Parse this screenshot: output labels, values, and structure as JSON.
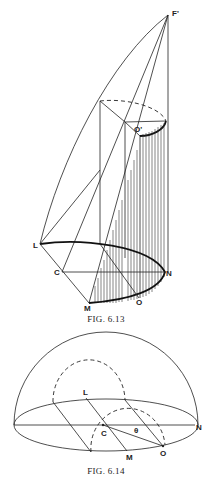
{
  "figures": [
    {
      "id": "fig-6-13",
      "caption": "FIG. 6.13",
      "labels": {
        "apex": "F'",
        "top_center": "O'",
        "L": "L",
        "C": "C",
        "N": "N",
        "M": "M",
        "O": "O"
      }
    },
    {
      "id": "fig-6-14",
      "caption": "FIG. 6.14",
      "labels": {
        "L": "L",
        "C": "C",
        "N": "N",
        "M": "M",
        "O": "O",
        "angle": "θ"
      }
    }
  ],
  "colors": {
    "ink": "#222222",
    "background": "#ffffff"
  }
}
